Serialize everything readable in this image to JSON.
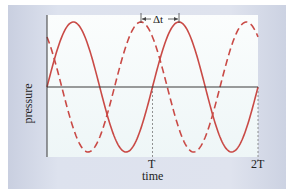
{
  "chart_data": {
    "type": "line",
    "title": "",
    "xlabel": "time",
    "ylabel": "pressure",
    "x_ticks": [
      "T",
      "2T"
    ],
    "annotation": "Δt",
    "annotation_meaning": "time offset between dashed-wave peak and solid-wave peak",
    "x_range": [
      0,
      2
    ],
    "x_unit": "T (period)",
    "y_range": [
      -1,
      1
    ],
    "grid": false,
    "legend": null,
    "series": [
      {
        "name": "solid wave",
        "style": "solid",
        "color": "#c94a46",
        "function": "sin(2π t/T)",
        "amplitude": 1,
        "phase_shift_T": 0
      },
      {
        "name": "dashed wave",
        "style": "dashed",
        "color": "#c94a46",
        "function": "sin(2π (t+Δt)/T)",
        "amplitude": 1,
        "phase_shift_T": 0.36
      }
    ],
    "reference_lines": [
      {
        "type": "horizontal",
        "y": 0,
        "label": "zero pressure axis"
      },
      {
        "type": "vertical",
        "x": 1,
        "style": "dotted",
        "label": "T"
      },
      {
        "type": "vertical",
        "x": 2,
        "style": "dotted",
        "label": "2T"
      }
    ]
  },
  "labels": {
    "ylabel": "pressure",
    "xlabel": "time",
    "tick_T": "T",
    "tick_2T": "2T",
    "delta_t": "Δt"
  },
  "colors": {
    "wave": "#c94a46",
    "axis": "#3a3a3a",
    "panel": "#dde2ee",
    "plot_bg": "#f3f9f9"
  }
}
